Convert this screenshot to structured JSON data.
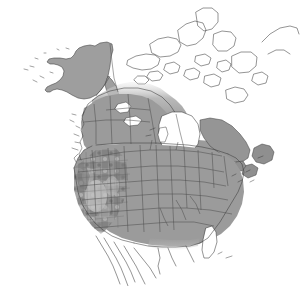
{
  "map": {
    "title": "North America distribution map",
    "region": "North America",
    "projection_note": "continental North America including Alaska, Canada, contiguous United States and northern Mexico",
    "has_title_text": false,
    "has_legend": false,
    "has_axis_labels": false,
    "has_scale_bar": false,
    "background_color": "#ffffff",
    "outline_color": "#3c3c3c",
    "admin_boundary_color": "#4a4a4a",
    "shading_description": "grayscale presence shading over states, provinces and counties",
    "colors": {
      "present_mid_gray": "#9b9b9b",
      "present_dark_gray": "#828282",
      "present_light_gray": "#c2c2c2",
      "absent_white": "#ffffff",
      "boundary": "#4a4a4a",
      "coastline": "#3c3c3c"
    },
    "shaded_regions": [
      {
        "name": "Alaska",
        "shade": "mid",
        "color": "#9e9e9e"
      },
      {
        "name": "Aleutian Islands",
        "shade": "none",
        "color": "#ffffff"
      },
      {
        "name": "Yukon",
        "shade": "light",
        "color": "#bcbcbc"
      },
      {
        "name": "Northwest Territories (south)",
        "shade": "light",
        "color": "#bdbdbd"
      },
      {
        "name": "British Columbia",
        "shade": "mid",
        "color": "#9b9b9b"
      },
      {
        "name": "Alberta",
        "shade": "mid",
        "color": "#9b9b9b"
      },
      {
        "name": "Saskatchewan",
        "shade": "mid",
        "color": "#9b9b9b"
      },
      {
        "name": "Manitoba",
        "shade": "mid",
        "color": "#9b9b9b"
      },
      {
        "name": "Ontario",
        "shade": "mid",
        "color": "#9b9b9b"
      },
      {
        "name": "Quebec",
        "shade": "mid",
        "color": "#9b9b9b"
      },
      {
        "name": "Newfoundland and Labrador",
        "shade": "mid",
        "color": "#8f8f8f"
      },
      {
        "name": "New Brunswick",
        "shade": "mid",
        "color": "#8f8f8f"
      },
      {
        "name": "Nova Scotia",
        "shade": "mid",
        "color": "#8f8f8f"
      },
      {
        "name": "Contiguous United States",
        "shade": "mid",
        "color": "#9b9b9b"
      },
      {
        "name": "Western United States counties",
        "shade": "mottled",
        "color": "#8a8a8a"
      }
    ],
    "unshaded_regions": [
      {
        "name": "Nunavut and Arctic Archipelago",
        "color": "#ffffff"
      },
      {
        "name": "Greenland edge",
        "color": "#ffffff"
      },
      {
        "name": "Hudson Bay",
        "color": "#ffffff"
      },
      {
        "name": "Great Lakes",
        "color": "#ffffff"
      },
      {
        "name": "Great Bear Lake",
        "color": "#ffffff"
      },
      {
        "name": "Great Slave Lake",
        "color": "#ffffff"
      },
      {
        "name": "Lake Winnipeg",
        "color": "#ffffff"
      },
      {
        "name": "Florida peninsula",
        "color": "#ffffff"
      },
      {
        "name": "Baja California",
        "color": "#ffffff"
      },
      {
        "name": "Mexico mainland",
        "color": "#ffffff"
      },
      {
        "name": "Ocean",
        "color": "#ffffff"
      }
    ]
  }
}
